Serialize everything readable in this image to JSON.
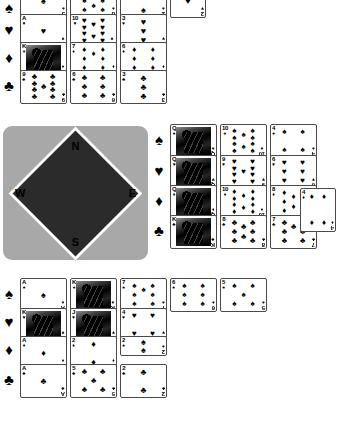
{
  "app": {
    "title": "Bridge Hand Diagram"
  },
  "compass": {
    "north_label": "N",
    "east_label": "E",
    "south_label": "S",
    "west_label": "W",
    "board_color": "#a8a8a8",
    "center_color": "#2b2b2b"
  },
  "suit_glyphs": {
    "spade": "♠",
    "heart": "♥",
    "diamond": "♦",
    "club": "♣"
  },
  "suit_row_labels": {
    "north": [
      "♠",
      "♥",
      "♦",
      "♣"
    ],
    "east": [
      "♠",
      "♥",
      "♦",
      "♣"
    ],
    "south": [
      "♠",
      "♥",
      "♦",
      "♣"
    ]
  },
  "hands": {
    "north": {
      "seat_label": "N",
      "rows": [
        {
          "suit": "spade",
          "suit_glyph": "♠",
          "cards": [
            {
              "rank": "J",
              "suit_glyph": "♠",
              "pips": 1,
              "face": false
            },
            {
              "rank": "8",
              "suit_glyph": "♠",
              "pips": 8,
              "face": false
            },
            {
              "rank": "2",
              "suit_glyph": "♠",
              "pips": 2,
              "face": false
            }
          ]
        },
        {
          "suit": "heart",
          "suit_glyph": "♥",
          "cards": [
            {
              "rank": "A",
              "suit_glyph": "♥",
              "pips": 1,
              "face": false
            },
            {
              "rank": "10",
              "suit_glyph": "♥",
              "pips": 10,
              "face": false
            },
            {
              "rank": "3",
              "suit_glyph": "♥",
              "pips": 3,
              "face": false
            }
          ]
        },
        {
          "suit": "diamond",
          "suit_glyph": "♦",
          "cards": [
            {
              "rank": "K",
              "suit_glyph": "♦",
              "pips": 0,
              "face": true
            },
            {
              "rank": "7",
              "suit_glyph": "♦",
              "pips": 7,
              "face": false
            },
            {
              "rank": "6",
              "suit_glyph": "♦",
              "pips": 6,
              "face": false
            }
          ]
        },
        {
          "suit": "club",
          "suit_glyph": "♣",
          "cards": [
            {
              "rank": "9",
              "suit_glyph": "♣",
              "pips": 9,
              "face": false
            },
            {
              "rank": "6",
              "suit_glyph": "♣",
              "pips": 6,
              "face": false
            },
            {
              "rank": "3",
              "suit_glyph": "♣",
              "pips": 3,
              "face": false
            }
          ]
        }
      ],
      "extra_card": {
        "rank": "2",
        "suit_glyph": "♥",
        "pips": 1,
        "face": false
      }
    },
    "east": {
      "seat_label": "E",
      "rows": [
        {
          "suit": "spade",
          "suit_glyph": "♠",
          "cards": [
            {
              "rank": "Q",
              "suit_glyph": "♠",
              "pips": 0,
              "face": true
            },
            {
              "rank": "10",
              "suit_glyph": "♠",
              "pips": 10,
              "face": false
            },
            {
              "rank": "4",
              "suit_glyph": "♠",
              "pips": 4,
              "face": false
            }
          ]
        },
        {
          "suit": "heart",
          "suit_glyph": "♥",
          "cards": [
            {
              "rank": "Q",
              "suit_glyph": "♥",
              "pips": 0,
              "face": true
            },
            {
              "rank": "9",
              "suit_glyph": "♥",
              "pips": 9,
              "face": false
            },
            {
              "rank": "6",
              "suit_glyph": "♥",
              "pips": 6,
              "face": false
            }
          ]
        },
        {
          "suit": "diamond",
          "suit_glyph": "♦",
          "cards": [
            {
              "rank": "Q",
              "suit_glyph": "♦",
              "pips": 0,
              "face": true
            },
            {
              "rank": "10",
              "suit_glyph": "♦",
              "pips": 10,
              "face": false
            },
            {
              "rank": "8",
              "suit_glyph": "♦",
              "pips": 8,
              "face": false
            }
          ]
        },
        {
          "suit": "club",
          "suit_glyph": "♣",
          "cards": [
            {
              "rank": "K",
              "suit_glyph": "♣",
              "pips": 0,
              "face": true
            },
            {
              "rank": "8",
              "suit_glyph": "♣",
              "pips": 8,
              "face": false
            },
            {
              "rank": "7",
              "suit_glyph": "♣",
              "pips": 7,
              "face": false
            }
          ]
        }
      ],
      "extra_card": {
        "rank": "4",
        "suit_glyph": "♦",
        "pips": 4,
        "face": false
      }
    },
    "south": {
      "seat_label": "S",
      "rows": [
        {
          "suit": "spade",
          "suit_glyph": "♠",
          "cards": [
            {
              "rank": "A",
              "suit_glyph": "♠",
              "pips": 1,
              "face": false
            },
            {
              "rank": "K",
              "suit_glyph": "♠",
              "pips": 0,
              "face": true
            },
            {
              "rank": "7",
              "suit_glyph": "♠",
              "pips": 7,
              "face": false
            },
            {
              "rank": "6",
              "suit_glyph": "♠",
              "pips": 6,
              "face": false
            },
            {
              "rank": "5",
              "suit_glyph": "♠",
              "pips": 5,
              "face": false
            }
          ]
        },
        {
          "suit": "heart",
          "suit_glyph": "♥",
          "cards": [
            {
              "rank": "K",
              "suit_glyph": "♥",
              "pips": 0,
              "face": true
            },
            {
              "rank": "J",
              "suit_glyph": "♥",
              "pips": 0,
              "face": true
            },
            {
              "rank": "4",
              "suit_glyph": "♥",
              "pips": 4,
              "face": false
            }
          ]
        },
        {
          "suit": "diamond",
          "suit_glyph": "♦",
          "cards": [
            {
              "rank": "A",
              "suit_glyph": "♦",
              "pips": 1,
              "face": false
            },
            {
              "rank": "2",
              "suit_glyph": "♦",
              "pips": 2,
              "face": false
            },
            {
              "rank": "2",
              "suit_glyph": "♠",
              "pips": 2,
              "face": false
            }
          ]
        },
        {
          "suit": "club",
          "suit_glyph": "♣",
          "cards": [
            {
              "rank": "A",
              "suit_glyph": "♣",
              "pips": 1,
              "face": false
            },
            {
              "rank": "5",
              "suit_glyph": "♣",
              "pips": 5,
              "face": false
            },
            {
              "rank": "2",
              "suit_glyph": "♣",
              "pips": 2,
              "face": false
            }
          ]
        }
      ]
    }
  }
}
